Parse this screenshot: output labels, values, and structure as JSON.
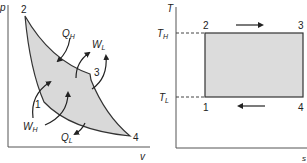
{
  "pv_diagram": {
    "y_axis_label": "p",
    "x_axis_label": "v",
    "points": [
      {
        "id": "1",
        "label": "1"
      },
      {
        "id": "2",
        "label": "2"
      },
      {
        "id": "3",
        "label": "3"
      },
      {
        "id": "4",
        "label": "4"
      }
    ],
    "annotations": {
      "QH": {
        "main": "Q",
        "sub": "H"
      },
      "WL": {
        "main": "W",
        "sub": "L"
      },
      "WH": {
        "main": "W",
        "sub": "H"
      },
      "QL": {
        "main": "Q",
        "sub": "L"
      }
    },
    "fill_color": "#d9d9d9",
    "stroke_color": "#333333"
  },
  "ts_diagram": {
    "y_axis_label": "T",
    "x_axis_label": "s",
    "points": [
      {
        "id": "1",
        "label": "1"
      },
      {
        "id": "2",
        "label": "2"
      },
      {
        "id": "3",
        "label": "3"
      },
      {
        "id": "4",
        "label": "4"
      }
    ],
    "levels": {
      "TH": {
        "main": "T",
        "sub": "H"
      },
      "TL": {
        "main": "T",
        "sub": "L"
      }
    },
    "fill_color": "#dcdcdc",
    "stroke_color": "#333333"
  }
}
